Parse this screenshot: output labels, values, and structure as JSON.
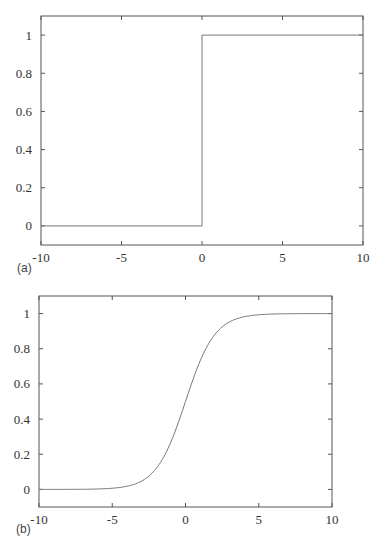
{
  "chart_data": [
    {
      "id": "a",
      "panel_label": "(a)",
      "type": "line",
      "title": "",
      "xlabel": "",
      "ylabel": "",
      "xlim": [
        -10,
        10
      ],
      "ylim": [
        -0.1,
        1.1
      ],
      "x_ticks": [
        -10,
        -5,
        0,
        5,
        10
      ],
      "x_tick_labels": [
        "-10",
        "-5",
        "0",
        "5",
        "10"
      ],
      "y_ticks": [
        0,
        0.2,
        0.4,
        0.6,
        0.8,
        1
      ],
      "y_tick_labels": [
        "0",
        "0.2",
        "0.4",
        "0.6",
        "0.8",
        "1"
      ],
      "grid": false,
      "legend": null,
      "series": [
        {
          "name": "step function",
          "x": [
            -10,
            0,
            0,
            10
          ],
          "y": [
            0,
            0,
            1,
            1
          ]
        }
      ]
    },
    {
      "id": "b",
      "panel_label": "(b)",
      "type": "line",
      "title": "",
      "xlabel": "",
      "ylabel": "",
      "xlim": [
        -10,
        10
      ],
      "ylim": [
        -0.1,
        1.1
      ],
      "x_ticks": [
        -10,
        -5,
        0,
        5,
        10
      ],
      "x_tick_labels": [
        "-10",
        "-5",
        "0",
        "5",
        "10"
      ],
      "y_ticks": [
        0,
        0.2,
        0.4,
        0.6,
        0.8,
        1
      ],
      "y_tick_labels": [
        "0",
        "0.2",
        "0.4",
        "0.6",
        "0.8",
        "1"
      ],
      "grid": false,
      "legend": null,
      "series": [
        {
          "name": "sigmoid (logistic) function",
          "x": [
            -10,
            -8,
            -6,
            -5,
            -4,
            -3,
            -2,
            -1,
            0,
            1,
            2,
            3,
            4,
            5,
            6,
            8,
            10
          ],
          "y": [
            0.0,
            0.0003,
            0.0025,
            0.0067,
            0.018,
            0.047,
            0.119,
            0.269,
            0.5,
            0.731,
            0.881,
            0.953,
            0.982,
            0.993,
            0.9975,
            0.9997,
            1.0
          ]
        }
      ]
    }
  ],
  "caption_partial": "Figure 2.11 ..."
}
